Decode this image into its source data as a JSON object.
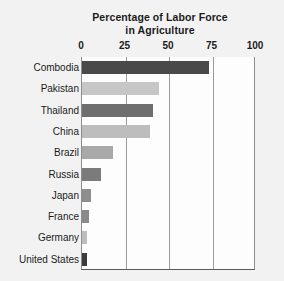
{
  "chart_data": {
    "type": "bar",
    "orientation": "horizontal",
    "title": "Percentage of Labor Force in Agriculture",
    "title_lines": [
      "Percentage of Labor Force",
      "in Agriculture"
    ],
    "xlabel": "",
    "ylabel": "",
    "xlim": [
      0,
      100
    ],
    "xticks": [
      0,
      25,
      50,
      75,
      100
    ],
    "xtick_labels": [
      "0",
      "25",
      "50",
      "75",
      "100"
    ],
    "grid": "vertical",
    "legend": "none",
    "categories": [
      "Combodia",
      "Pakistan",
      "Thailand",
      "China",
      "Brazil",
      "Russia",
      "Japan",
      "France",
      "Germany",
      "United States"
    ],
    "values": [
      73,
      44,
      41,
      39,
      18,
      11,
      5,
      4,
      3,
      3
    ],
    "bar_colors": [
      "#4a4a4a",
      "#c6c6c6",
      "#6e6e6e",
      "#bdbdbd",
      "#a8a8a8",
      "#7b7b7b",
      "#8e8e8e",
      "#8a8a8a",
      "#bdbdbd",
      "#3d3d3d"
    ],
    "bars": [
      {
        "label": "Combodia",
        "value": 73,
        "color": "#4a4a4a"
      },
      {
        "label": "Pakistan",
        "value": 44,
        "color": "#c6c6c6"
      },
      {
        "label": "Thailand",
        "value": 41,
        "color": "#6e6e6e"
      },
      {
        "label": "China",
        "value": 39,
        "color": "#bdbdbd"
      },
      {
        "label": "Brazil",
        "value": 18,
        "color": "#a8a8a8"
      },
      {
        "label": "Russia",
        "value": 11,
        "color": "#7b7b7b"
      },
      {
        "label": "Japan",
        "value": 5,
        "color": "#8e8e8e"
      },
      {
        "label": "France",
        "value": 4,
        "color": "#8a8a8a"
      },
      {
        "label": "Germany",
        "value": 3,
        "color": "#bdbdbd"
      },
      {
        "label": "United States",
        "value": 3,
        "color": "#3d3d3d"
      }
    ]
  },
  "colors": {
    "page_background": "#f2f2f2",
    "plot_background": "#fdfdfd",
    "gridline": "#9a9a9a",
    "axis": "#5a5a5a",
    "text": "#1b1b1b"
  }
}
